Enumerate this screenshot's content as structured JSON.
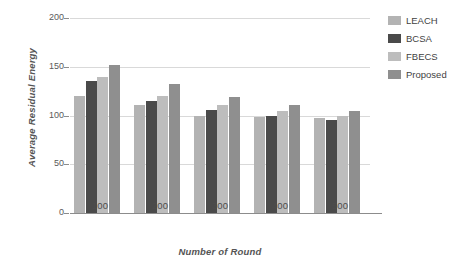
{
  "chart_data": {
    "type": "bar",
    "title": "",
    "subtitle": "",
    "xlabel": "Number of Round",
    "ylabel": "Average Residual Energy",
    "categories": [
      "100",
      "200",
      "300",
      "400",
      "500"
    ],
    "series": [
      {
        "name": "LEACH",
        "color": "#b3b3b3",
        "values": [
          120,
          111,
          99,
          98,
          97
        ]
      },
      {
        "name": "BCSA",
        "color": "#4a4a4a",
        "values": [
          135,
          115,
          106,
          100,
          95
        ]
      },
      {
        "name": "FBECS",
        "color": "#bdbdbd",
        "values": [
          140,
          120,
          111,
          105,
          100
        ]
      },
      {
        "name": "Proposed",
        "color": "#8f8f8f",
        "values": [
          152,
          132,
          119,
          111,
          105
        ]
      }
    ],
    "ylim": [
      0,
      200
    ],
    "yticks": [
      0,
      50,
      100,
      150,
      200
    ],
    "ytick_labels": [
      "0",
      "50",
      "100",
      "150",
      "200"
    ],
    "grid": true,
    "grid_axis": "y",
    "legend_position": "right"
  },
  "legend": {
    "items": [
      {
        "label": "LEACH"
      },
      {
        "label": "BCSA"
      },
      {
        "label": "FBECS"
      },
      {
        "label": "Proposed"
      }
    ]
  }
}
